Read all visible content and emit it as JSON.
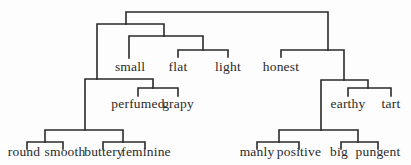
{
  "diagram": {
    "type": "dendrogram",
    "title": "",
    "leaves": [
      {
        "id": "small",
        "label": "small",
        "x": 130,
        "y": 60
      },
      {
        "id": "flat",
        "label": "flat",
        "x": 178,
        "y": 60
      },
      {
        "id": "light",
        "label": "light",
        "x": 228,
        "y": 60
      },
      {
        "id": "honest",
        "label": "honest",
        "x": 281,
        "y": 60
      },
      {
        "id": "perfumed",
        "label": "perfumed",
        "x": 138,
        "y": 97
      },
      {
        "id": "grapy",
        "label": "grapy",
        "x": 178,
        "y": 97
      },
      {
        "id": "earthy",
        "label": "earthy",
        "x": 348,
        "y": 97
      },
      {
        "id": "tart",
        "label": "tart",
        "x": 391,
        "y": 97
      },
      {
        "id": "round",
        "label": "round",
        "x": 24,
        "y": 145
      },
      {
        "id": "smooth",
        "label": "smooth",
        "x": 65,
        "y": 145
      },
      {
        "id": "buttery",
        "label": "buttery",
        "x": 104,
        "y": 145
      },
      {
        "id": "feminine",
        "label": "feminine",
        "x": 146,
        "y": 145
      },
      {
        "id": "manly",
        "label": "manly",
        "x": 257,
        "y": 145
      },
      {
        "id": "positive",
        "label": "positive",
        "x": 299,
        "y": 145
      },
      {
        "id": "big",
        "label": "big",
        "x": 339,
        "y": 145
      },
      {
        "id": "pungent",
        "label": "pungent",
        "x": 378,
        "y": 145
      }
    ],
    "edges": [
      {
        "d": "M126 24 V12 H328 V50"
      },
      {
        "d": "M97 79 V24 H164 V36"
      },
      {
        "d": "M129 58 V36 H203 V50"
      },
      {
        "d": "M178 57 V50 H228 V57"
      },
      {
        "d": "M85 130 V79 H153 V88"
      },
      {
        "d": "M138 96 V88 H178 V96"
      },
      {
        "d": "M45 142 V130 H123 V142"
      },
      {
        "d": "M27 149 V142 H63 V149"
      },
      {
        "d": "M103 149 V142 H145 V149"
      },
      {
        "d": "M281 57 V50 H344 V80"
      },
      {
        "d": "M321 130 V80 H368 V88"
      },
      {
        "d": "M348 96 V88 H391 V96"
      },
      {
        "d": "M279 142 V130 H358 V142"
      },
      {
        "d": "M257 149 V142 H299 V149"
      },
      {
        "d": "M341 149 V142 H378 V149"
      }
    ],
    "line_color": "#2a2a2a"
  }
}
